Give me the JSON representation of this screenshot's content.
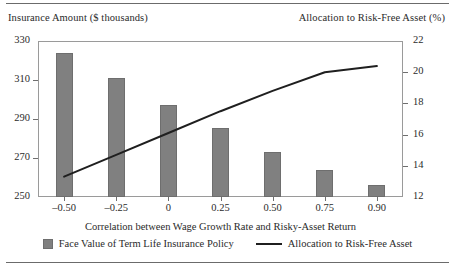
{
  "chart_data": {
    "type": "bar",
    "title": "",
    "xlabel": "Correlation between Wage Growth Rate and Risky-Asset Return",
    "ylabel": "Insurance Amount ($ thousands)",
    "ylabel_secondary": "Allocation to Risk-Free Asset (%)",
    "categories": [
      "–0.50",
      "–0.25",
      "0",
      "0.25",
      "0.50",
      "0.75",
      "0.90"
    ],
    "ylim": [
      250,
      330
    ],
    "yticks": [
      250,
      270,
      290,
      310,
      330
    ],
    "ylim_secondary": [
      12,
      22
    ],
    "yticks_secondary": [
      12,
      14,
      16,
      18,
      20,
      22
    ],
    "grid": false,
    "legend_position": "bottom",
    "series": [
      {
        "name": "Face Value of Term Life Insurance Policy",
        "type": "bar",
        "axis": "left",
        "color": "#808080",
        "values": [
          324,
          311,
          297,
          285.5,
          273,
          264,
          256
        ]
      },
      {
        "name": "Allocation to Risk-Free Asset",
        "type": "line",
        "axis": "right",
        "color": "#1f1f1f",
        "values": [
          13.3,
          14.7,
          16.1,
          17.5,
          18.8,
          20.0,
          20.4
        ]
      }
    ]
  },
  "legend": {
    "bar_label": "Face Value of Term Life Insurance Policy",
    "line_label": "Allocation to Risk-Free Asset"
  }
}
